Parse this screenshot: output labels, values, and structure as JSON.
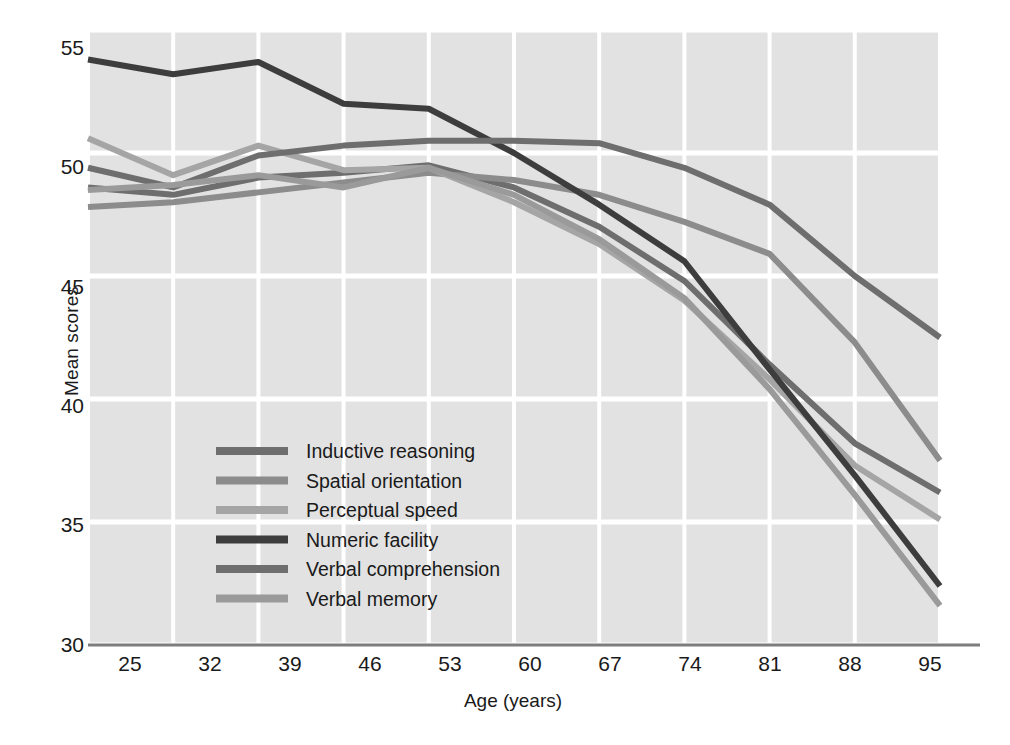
{
  "chart_data": {
    "type": "line",
    "title": "",
    "xlabel": "Age (years)",
    "ylabel": "Mean scores",
    "x": [
      25,
      32,
      39,
      46,
      53,
      60,
      67,
      74,
      81,
      88,
      95
    ],
    "xticklabels": [
      "25",
      "32",
      "39",
      "46",
      "53",
      "60",
      "67",
      "74",
      "81",
      "88",
      "95"
    ],
    "yticklabels": [
      "30",
      "35",
      "40",
      "45",
      "50",
      "55"
    ],
    "yticks": [
      30,
      35,
      40,
      45,
      50,
      55
    ],
    "xlim": [
      25,
      95
    ],
    "ylim": [
      30,
      55
    ],
    "grid": true,
    "legend_position": "lower-left-inside",
    "plot_background": "#e2e2e2",
    "grid_color": "#ffffff",
    "series": [
      {
        "name": "Inductive reasoning",
        "color": "#6e6e6e",
        "values": [
          48.6,
          48.3,
          49.0,
          49.2,
          49.5,
          48.6,
          47.0,
          44.8,
          41.4,
          38.2,
          36.2
        ]
      },
      {
        "name": "Spatial orientation",
        "color": "#8c8c8c",
        "values": [
          47.8,
          48.0,
          48.4,
          48.8,
          49.2,
          48.9,
          48.3,
          47.2,
          45.9,
          42.3,
          37.5
        ]
      },
      {
        "name": "Perceptual speed",
        "color": "#a5a5a5",
        "values": [
          50.6,
          49.1,
          50.3,
          49.3,
          49.4,
          48.0,
          46.3,
          44.0,
          40.8,
          37.3,
          35.1
        ]
      },
      {
        "name": "Numeric facility",
        "color": "#3d3d3d",
        "values": [
          53.8,
          53.2,
          53.7,
          52.0,
          51.8,
          50.0,
          47.9,
          45.6,
          41.2,
          36.9,
          32.4
        ]
      },
      {
        "name": "Verbal comprehension",
        "color": "#6e6e6e",
        "values": [
          49.4,
          48.6,
          49.9,
          50.3,
          50.5,
          50.5,
          50.4,
          49.4,
          47.9,
          45.0,
          42.5
        ]
      },
      {
        "name": "Verbal memory",
        "color": "#9a9a9a",
        "values": [
          48.5,
          48.7,
          49.1,
          48.6,
          49.4,
          48.3,
          46.5,
          44.1,
          40.4,
          36.1,
          31.6
        ]
      }
    ],
    "legend": [
      "Inductive reasoning",
      "Spatial orientation",
      "Perceptual speed",
      "Numeric facility",
      "Verbal comprehension",
      "Verbal memory"
    ]
  }
}
